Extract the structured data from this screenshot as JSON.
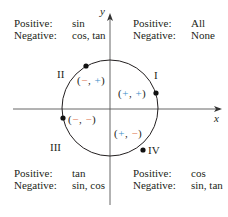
{
  "axes": {
    "x_label": "x",
    "y_label": "y"
  },
  "colors": {
    "negative_sign": "#e07b54",
    "positive_sign": "#3a8fc9",
    "ink": "#231f20"
  },
  "quadrants": [
    {
      "id": "I",
      "numeral": "I",
      "positive_label": "Positive:",
      "positive_value": "All",
      "negative_label": "Negative:",
      "negative_value": "None",
      "sign_open": "(",
      "sign_x": "+",
      "sign_comma": ", ",
      "sign_y": "+",
      "sign_close": ")"
    },
    {
      "id": "II",
      "numeral": "II",
      "positive_label": "Positive:",
      "positive_value": "sin",
      "negative_label": "Negative:",
      "negative_value": "cos, tan",
      "sign_open": "(",
      "sign_x": "−",
      "sign_comma": ", ",
      "sign_y": "+",
      "sign_close": ")"
    },
    {
      "id": "III",
      "numeral": "III",
      "positive_label": "Positive:",
      "positive_value": "tan",
      "negative_label": "Negative:",
      "negative_value": "sin, cos",
      "sign_open": "(",
      "sign_x": "−",
      "sign_comma": ", ",
      "sign_y": "−",
      "sign_close": ")"
    },
    {
      "id": "IV",
      "numeral": "IV",
      "positive_label": "Positive:",
      "positive_value": "cos",
      "negative_label": "Negative:",
      "negative_value": "sin, tan",
      "sign_open": "(",
      "sign_x": "+",
      "sign_comma": ", ",
      "sign_y": "−",
      "sign_close": ")"
    }
  ]
}
